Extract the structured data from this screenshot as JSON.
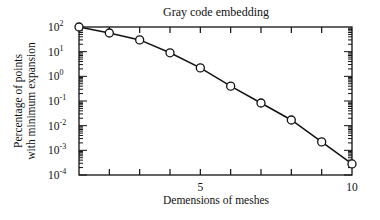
{
  "chart_data": {
    "type": "line",
    "title": "Gray code embedding",
    "xlabel": "Demensions of meshes",
    "ylabel": [
      "Percentage of points",
      "with minimum expansion"
    ],
    "xlim": [
      1,
      10
    ],
    "ylim": [
      0.0001,
      100
    ],
    "yscale": "log",
    "grid": false,
    "legend": "none",
    "x_ticks": [
      1,
      2,
      3,
      4,
      5,
      6,
      7,
      8,
      9,
      10
    ],
    "x_tick_labels": [
      {
        "value": 5,
        "label": "5"
      },
      {
        "value": 10,
        "label": "10"
      }
    ],
    "y_tick_labels": [
      {
        "value": 100,
        "base": "10",
        "exp": "2"
      },
      {
        "value": 10,
        "base": "10",
        "exp": "1"
      },
      {
        "value": 1,
        "base": "10",
        "exp": "0"
      },
      {
        "value": 0.1,
        "base": "10",
        "exp": "-1"
      },
      {
        "value": 0.01,
        "base": "10",
        "exp": "-2"
      },
      {
        "value": 0.001,
        "base": "10",
        "exp": "-3"
      },
      {
        "value": 0.0001,
        "base": "10",
        "exp": "-4"
      }
    ],
    "series": [
      {
        "name": "Gray code embedding",
        "marker": "open-circle",
        "x": [
          1,
          2,
          3,
          4,
          5,
          6,
          7,
          8,
          9,
          10
        ],
        "values": [
          100,
          57,
          30,
          9,
          2.2,
          0.4,
          0.083,
          0.017,
          0.0022,
          0.00028
        ]
      }
    ]
  }
}
